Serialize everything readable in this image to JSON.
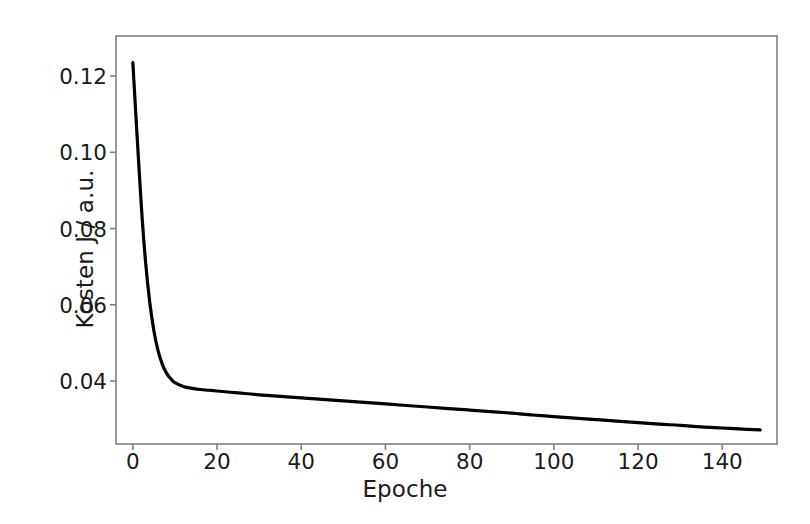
{
  "chart_data": {
    "type": "line",
    "title": "",
    "xlabel": "Epoche",
    "ylabel": "Kosten J / a.u.",
    "xlim": [
      -4,
      153
    ],
    "ylim": [
      0.0235,
      0.1305
    ],
    "xticks": [
      0,
      20,
      40,
      60,
      80,
      100,
      120,
      140
    ],
    "xtick_labels": [
      "0",
      "20",
      "40",
      "60",
      "80",
      "100",
      "120",
      "140"
    ],
    "yticks": [
      0.04,
      0.06,
      0.08,
      0.1,
      0.12
    ],
    "ytick_labels": [
      "0.04",
      "0.06",
      "0.08",
      "0.10",
      "0.12"
    ],
    "grid": false,
    "legend": null,
    "line_color": "#000000",
    "line_width": 3.2,
    "frame_color": "#808080",
    "background_color": "#ffffff",
    "series": [
      {
        "name": "Kosten J",
        "x": [
          0,
          1,
          2,
          3,
          4,
          5,
          6,
          7,
          8,
          9,
          10,
          12,
          14,
          16,
          18,
          20,
          25,
          30,
          35,
          40,
          45,
          50,
          55,
          60,
          65,
          70,
          75,
          80,
          85,
          90,
          95,
          100,
          105,
          110,
          115,
          120,
          125,
          130,
          135,
          140,
          145,
          149
        ],
        "y": [
          0.1235,
          0.1045,
          0.0862,
          0.0715,
          0.0608,
          0.0532,
          0.0479,
          0.0444,
          0.0421,
          0.0406,
          0.0396,
          0.0386,
          0.0381,
          0.0378,
          0.0376,
          0.0374,
          0.0369,
          0.0364,
          0.036,
          0.0356,
          0.0352,
          0.0348,
          0.0344,
          0.034,
          0.0336,
          0.0332,
          0.0328,
          0.0324,
          0.032,
          0.0316,
          0.0311,
          0.0307,
          0.0303,
          0.0299,
          0.0295,
          0.0291,
          0.0287,
          0.0284,
          0.028,
          0.0277,
          0.0274,
          0.0272
        ]
      }
    ]
  }
}
